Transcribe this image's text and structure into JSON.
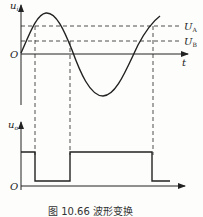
{
  "figure": {
    "caption": "图 10.66   波形变换",
    "top_plot": {
      "y_axis_label": "u",
      "y_axis_subscript": "i",
      "x_axis_label": "t",
      "origin_label": "O",
      "thresholds": [
        {
          "label": "U",
          "subscript": "A",
          "level": "upper"
        },
        {
          "label": "U",
          "subscript": "B",
          "level": "lower"
        }
      ],
      "waveform": "sine"
    },
    "bottom_plot": {
      "y_axis_label": "u",
      "y_axis_subscript": "o",
      "origin_label": "O",
      "waveform": "square"
    }
  },
  "colors": {
    "line": "#222222",
    "background": "#fdfdfb"
  }
}
